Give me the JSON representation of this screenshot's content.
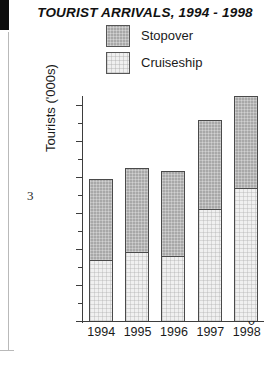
{
  "chart_data": {
    "type": "bar",
    "subtype": "stacked-vertical-bar",
    "title": "TOURIST ARRIVALS, 1994 - 1998",
    "xlabel": "",
    "ylabel": "Tourists ('000s)",
    "categories": [
      "1994",
      "1995",
      "1996",
      "1997",
      "1998"
    ],
    "series": [
      {
        "name": "Cruiseship",
        "values": [
          170,
          192,
          180,
          310,
          370
        ],
        "color": "#efefef"
      },
      {
        "name": "Stopover",
        "values": [
          225,
          233,
          237,
          248,
          255
        ],
        "color": "#a8a8a8"
      }
    ],
    "totals": [
      395,
      425,
      417,
      558,
      625
    ],
    "ylim": [
      0,
      650
    ],
    "yticks": [
      0,
      100,
      200,
      300,
      400,
      500,
      600
    ],
    "ytick_labels": [
      "0",
      "100",
      "200",
      "300",
      "400",
      "500",
      "600"
    ],
    "minor_tick_interval": 50,
    "grid": false,
    "legend_position": "top-center",
    "legend_order": [
      "Stopover",
      "Cruiseship"
    ]
  },
  "legend": {
    "items": [
      {
        "label": "Stopover",
        "swatch": "stopover-swatch"
      },
      {
        "label": "Cruiseship",
        "swatch": "cruiseship-swatch"
      }
    ]
  },
  "page": {
    "number": "3"
  }
}
